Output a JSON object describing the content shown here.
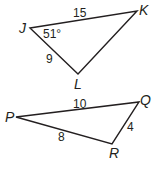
{
  "figures": [
    {
      "name": "triangle-JKL",
      "vertices": {
        "J": [
          30,
          28
        ],
        "K": [
          137,
          11
        ],
        "L": [
          78,
          74
        ]
      },
      "labels": {
        "J": "J",
        "K": "K",
        "L": "L"
      },
      "sides": {
        "JK": "15",
        "JL": "9"
      },
      "angle": {
        "J": "51°"
      }
    },
    {
      "name": "triangle-PQR",
      "vertices": {
        "P": [
          16,
          117
        ],
        "Q": [
          139,
          102
        ],
        "R": [
          112,
          144
        ]
      },
      "labels": {
        "P": "P",
        "Q": "Q",
        "R": "R"
      },
      "sides": {
        "PQ": "10",
        "PR": "8",
        "QR": "4"
      }
    }
  ],
  "colors": {
    "stroke": "#231f20",
    "background": "#ffffff"
  }
}
